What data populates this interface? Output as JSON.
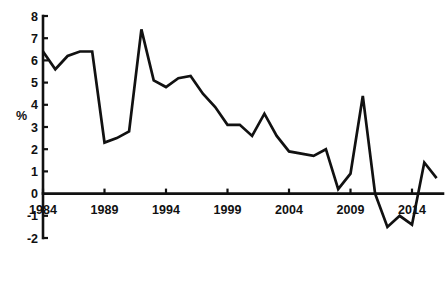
{
  "chart_data": {
    "type": "line",
    "title": "",
    "subtitle": "",
    "xlabel": "",
    "ylabel": "%",
    "xlim": [
      1983.5,
      2016.5
    ],
    "ylim": [
      -2,
      8
    ],
    "grid": false,
    "legend": null,
    "legend_position": "none",
    "x_tick_labels": [
      "1984",
      "1989",
      "1994",
      "1999",
      "2004",
      "2009",
      "2014"
    ],
    "x_ticks": [
      1984,
      1989,
      1994,
      1999,
      2004,
      2009,
      2014
    ],
    "y_tick_labels": [
      "8",
      "7",
      "6",
      "5",
      "4",
      "3",
      "2",
      "1",
      "0",
      "-1",
      "-2"
    ],
    "y_ticks": [
      8,
      7,
      6,
      5,
      4,
      3,
      2,
      1,
      0,
      -1,
      -2
    ],
    "zero_line": 0,
    "series": [
      {
        "name": "series-1",
        "color": "#111111",
        "x": [
          1984,
          1985,
          1986,
          1987,
          1988,
          1989,
          1990,
          1991,
          1992,
          1993,
          1994,
          1995,
          1996,
          1997,
          1998,
          1999,
          2000,
          2001,
          2002,
          2003,
          2004,
          2005,
          2006,
          2007,
          2008,
          2009,
          2010,
          2011,
          2012,
          2013,
          2014,
          2015,
          2016
        ],
        "values": [
          6.4,
          5.6,
          6.2,
          6.4,
          6.4,
          2.3,
          2.5,
          2.8,
          7.4,
          5.1,
          4.8,
          5.2,
          5.3,
          4.5,
          3.9,
          3.1,
          3.1,
          2.6,
          3.6,
          2.6,
          1.9,
          1.8,
          1.7,
          2.0,
          0.2,
          0.9,
          4.4,
          0.0,
          -1.5,
          -1.0,
          -1.4,
          1.4,
          0.7
        ]
      }
    ]
  },
  "axes": {
    "y_axis_title": "%"
  }
}
